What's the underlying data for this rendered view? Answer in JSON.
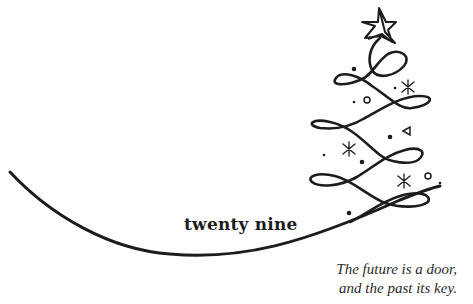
{
  "card": {
    "title": "twenty nine",
    "quote": {
      "line1": "The future is a door,",
      "line2": "and the past its key."
    },
    "ink_color": "#1c1c1c",
    "background": "#ffffff"
  },
  "illustration": {
    "icons": [
      "star-icon",
      "swirl-christmas-tree-icon",
      "snowflake-icon",
      "circle-ornament-icon",
      "triangle-ornament-icon",
      "dot-ornament-icon",
      "ribbon-curve-icon"
    ]
  }
}
